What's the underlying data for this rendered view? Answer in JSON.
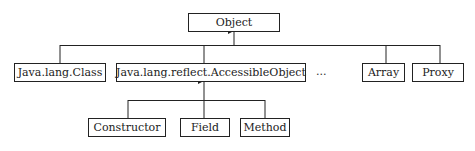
{
  "diagram": {
    "root": "Object",
    "level1": [
      "Java.lang.Class",
      "Java.lang.reflect.AccessibleObject",
      "...",
      "Array",
      "Proxy"
    ],
    "level2_parent": "Java.lang.reflect.AccessibleObject",
    "level2": [
      "Constructor",
      "Field",
      "Method"
    ],
    "colors": {
      "line": "#222222",
      "background": "#ffffff"
    }
  }
}
